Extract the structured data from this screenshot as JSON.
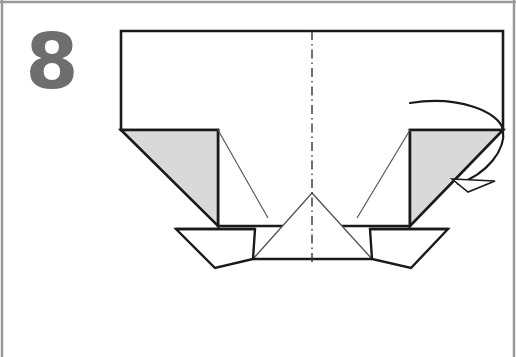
{
  "figure": {
    "step_label": "8",
    "canvas": {
      "width": 516,
      "height": 357
    },
    "colors": {
      "background": "#ffffff",
      "paper_face": "#ffffff",
      "shaded_face": "#d9d9d9",
      "outline_heavy": "#1a1a1a",
      "outline_light": "#555555",
      "step_number": "#6e6e6e",
      "frame_border": "#9a9a9a",
      "centerline": "#333333"
    },
    "frame": {
      "name": "image-frame",
      "top_rule_y": 2,
      "left_rule_x": 2,
      "right_rule_x": 514
    },
    "shapes": [
      {
        "name": "main-body-panel",
        "kind": "polygon",
        "points": "121,31 503,31 503,130 410,130 410,226 218,226 218,130 121,130",
        "fill": "#ffffff",
        "stroke": "#1a1a1a",
        "stroke_width": 2.6
      },
      {
        "name": "left-shaded-triangle",
        "kind": "polygon",
        "points": "121,130 218,130 218,226",
        "fill": "#d9d9d9",
        "stroke": "#1a1a1a",
        "stroke_width": 2.6
      },
      {
        "name": "right-shaded-triangle",
        "kind": "polygon",
        "points": "503,130 410,130 410,226",
        "fill": "#d9d9d9",
        "stroke": "#1a1a1a",
        "stroke_width": 2.6
      },
      {
        "name": "left-fold-crease",
        "kind": "line",
        "points": "218,130 268,218",
        "stroke": "#555555",
        "stroke_width": 1.2
      },
      {
        "name": "right-fold-crease",
        "kind": "line",
        "points": "410,130 357,218",
        "stroke": "#555555",
        "stroke_width": 1.2
      },
      {
        "name": "center-peak-triangle",
        "kind": "polygon",
        "points": "312,193 372,259 253,259",
        "fill": "#ffffff",
        "stroke": "#555555",
        "stroke_width": 1.4
      },
      {
        "name": "bottom-left-flap",
        "kind": "polygon",
        "points": "176,229 255,229 253,259 215,268",
        "fill": "#ffffff",
        "stroke": "#1a1a1a",
        "stroke_width": 2.4
      },
      {
        "name": "bottom-right-flap",
        "kind": "polygon",
        "points": "448,229 370,229 372,259 411,268",
        "fill": "#ffffff",
        "stroke": "#1a1a1a",
        "stroke_width": 2.4
      },
      {
        "name": "bottom-edge-line",
        "kind": "line",
        "points": "253,259 372,259",
        "stroke": "#1a1a1a",
        "stroke_width": 2.4
      },
      {
        "name": "left-flap-top-edge",
        "kind": "line",
        "points": "176,229 255,229",
        "stroke": "#1a1a1a",
        "stroke_width": 2.4
      },
      {
        "name": "right-flap-top-edge",
        "kind": "line",
        "points": "370,229 448,229",
        "stroke": "#1a1a1a",
        "stroke_width": 2.4
      }
    ],
    "centerline": {
      "name": "vertical-center-dash-dot-line",
      "x": 312,
      "y_start": 31,
      "y_end": 262,
      "style": "dash-dot",
      "dash_pattern": "9 4 1.5 4",
      "stroke": "#333333",
      "stroke_width": 1.4
    },
    "arrow": {
      "name": "fold-rotation-arrow",
      "description": "curved arrow wrapping around right corner indicating fold direction",
      "path": "M 410,103 C 458,95 500,112 503,130 C 506,150 487,174 458,184",
      "stroke": "#1a1a1a",
      "stroke_width": 2.2,
      "arrowhead_points": "452,179 495,181 468,192",
      "arrowhead_fill": "#ffffff"
    }
  }
}
